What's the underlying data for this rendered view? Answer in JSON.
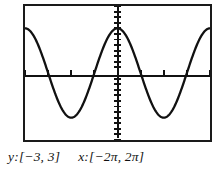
{
  "screen": {
    "width": 221,
    "height": 172,
    "background_color": "#ffffff",
    "ink_color": "#1a1a1a"
  },
  "graph": {
    "frame_label": "graphing-calculator-screen",
    "border_color": "#1a1a1a",
    "curve_color": "#111111",
    "axis_color": "#111111"
  },
  "caption": {
    "y_range_label": "y:[−3, 3]",
    "x_range_label": "x:[−2π, 2π]"
  },
  "chart_data": {
    "type": "line",
    "title": "",
    "subtitle": "",
    "xlabel": "",
    "ylabel": "",
    "function": "y = 2cos(x)",
    "xlim": [
      -6.283185307,
      6.283185307
    ],
    "ylim": [
      -3,
      3
    ],
    "xlim_label": "[−2π, 2π]",
    "ylim_label": "[−3, 3]",
    "grid": false,
    "legend": "none",
    "x_tick_interval": 1.570796327,
    "x_tick_interval_label": "π/2",
    "y_tick_interval": 0.25,
    "x_ticks": [
      -6.283185307,
      -4.71238898,
      -3.141592654,
      -1.570796327,
      0,
      1.570796327,
      3.141592654,
      4.71238898,
      6.283185307
    ],
    "y_ticks": [
      -3,
      -2.75,
      -2.5,
      -2.25,
      -2,
      -1.75,
      -1.5,
      -1.25,
      -1,
      -0.75,
      -0.5,
      -0.25,
      0,
      0.25,
      0.5,
      0.75,
      1,
      1.25,
      1.5,
      1.75,
      2,
      2.25,
      2.5,
      2.75,
      3
    ],
    "series": [
      {
        "name": "y = 2cos(x)",
        "amplitude": 2,
        "period": 6.283185307,
        "x": [
          -6.283185307,
          -5.969026042,
          -5.654866776,
          -5.340707511,
          -5.026548246,
          -4.71238898,
          -4.398229715,
          -4.08407045,
          -3.769911184,
          -3.455751919,
          -3.141592654,
          -2.827433388,
          -2.513274123,
          -2.199114858,
          -1.884955592,
          -1.570796327,
          -1.256637061,
          -0.942477796,
          -0.628318531,
          -0.314159265,
          0,
          0.314159265,
          0.628318531,
          0.942477796,
          1.256637061,
          1.570796327,
          1.884955592,
          2.199114858,
          2.513274123,
          2.827433388,
          3.141592654,
          3.455751919,
          3.769911184,
          4.08407045,
          4.398229715,
          4.71238898,
          5.026548246,
          5.340707511,
          5.654866776,
          5.969026042,
          6.283185307
        ],
        "y": [
          2,
          1.902,
          1.618,
          1.176,
          0.618,
          0,
          -0.618,
          -1.176,
          -1.618,
          -1.902,
          -2,
          -1.902,
          -1.618,
          -1.176,
          -0.618,
          0,
          0.618,
          1.176,
          1.618,
          1.902,
          2,
          1.902,
          1.618,
          1.176,
          0.618,
          0,
          -0.618,
          -1.176,
          -1.618,
          -1.902,
          -2,
          -1.902,
          -1.618,
          -1.176,
          -0.618,
          0,
          0.618,
          1.176,
          1.618,
          1.902,
          2
        ]
      }
    ],
    "annotations": [
      {
        "text": "y:[−3, 3]",
        "position": "below-plot-left"
      },
      {
        "text": "x:[−2π, 2π]",
        "position": "below-plot-right"
      }
    ]
  }
}
